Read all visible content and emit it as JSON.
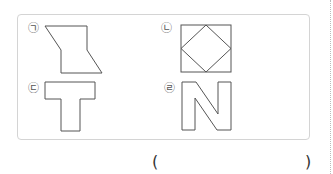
{
  "problem": {
    "options": [
      {
        "marker": "㉠",
        "shape": "z-shaped hexagon (parallelogram-like sides)"
      },
      {
        "marker": "㉡",
        "shape": "square with inscribed diamond"
      },
      {
        "marker": "㉢",
        "shape": "T shape"
      },
      {
        "marker": "㉣",
        "shape": "N shape"
      }
    ],
    "answer_open": "(",
    "answer_close": ")",
    "answer_value": ""
  },
  "colors": {
    "stroke": "#555555",
    "frame_border": "#d4d4d4"
  }
}
